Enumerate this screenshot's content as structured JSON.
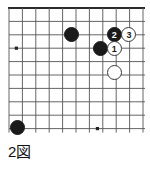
{
  "figure": {
    "caption": "2図",
    "caption_meaning": "Figure 2",
    "kind": "go-board-diagram"
  },
  "board": {
    "columns": 11,
    "rows": 10,
    "origin_x": 9,
    "origin_y": 8,
    "spacing": 13.4,
    "line_color": "#555555",
    "edge_color": "#2a2a2a",
    "background_color": "#ffffff",
    "star_points": [
      {
        "col": 0.55,
        "row": 3.0
      },
      {
        "col": 6.6,
        "row": 9.0
      }
    ]
  },
  "stones": [
    {
      "id": "black-upper-left-area",
      "color": "black",
      "label": "",
      "col": 4.65,
      "row": 2.0
    },
    {
      "id": "black-center",
      "color": "black",
      "label": "",
      "col": 6.8,
      "row": 3.0
    },
    {
      "id": "move-2",
      "color": "black",
      "label": "2",
      "col": 7.85,
      "row": 2.0
    },
    {
      "id": "move-3",
      "color": "white",
      "label": "3",
      "col": 8.95,
      "row": 2.0
    },
    {
      "id": "move-1",
      "color": "white",
      "label": "1",
      "col": 7.85,
      "row": 3.0
    },
    {
      "id": "white-lower",
      "color": "white",
      "label": "",
      "col": 7.85,
      "row": 4.8
    },
    {
      "id": "black-lower-left",
      "color": "black",
      "label": "",
      "col": 0.65,
      "row": 8.95
    }
  ],
  "colors": {
    "black_stone": "#1a1a1a",
    "white_stone": "#ffffff",
    "white_stone_border": "#3a3a3a",
    "grid": "#555555",
    "text": "#111111"
  }
}
